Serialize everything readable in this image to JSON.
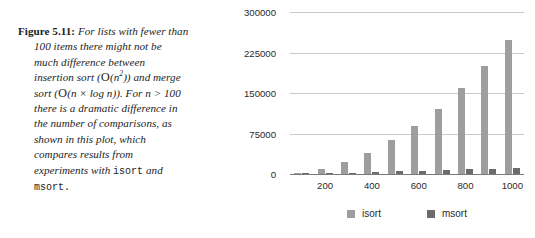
{
  "caption": {
    "figure_label": "Figure 5.11:",
    "lines": [
      "For lists with fewer than",
      "100 items there might not be",
      "much difference between",
      "insertion sort (O(n2)) and merge",
      "sort (O(n × log n)). For n > 100",
      "there is a dramatic difference in",
      "the number of comparisons, as",
      "shown in this plot, which",
      "compares results from",
      "experiments with isort and",
      "msort."
    ],
    "line1": "For lists with fewer than",
    "line2": "100 items there might not be",
    "line3": "much difference between",
    "line4_a": "insertion sort (",
    "line4_cal": "O",
    "line4_b": "(n",
    "line4_exp": "2",
    "line4_c": ")) and merge",
    "line5_a": "sort (",
    "line5_cal": "O",
    "line5_b": "(n × log n)). For ",
    "line5_n": "n",
    "line5_c": " > 100",
    "line6": "there is a dramatic difference in",
    "line7": "the number of comparisons, as",
    "line8": "shown in this plot, which",
    "line9": "compares results from",
    "line10_a": "experiments with ",
    "line10_mono": "isort",
    "line10_b": " and",
    "line11_mono": "msort",
    "line11_b": "."
  },
  "chart_data": {
    "type": "bar",
    "title": "",
    "xlabel": "",
    "ylabel": "",
    "ylim": [
      0,
      300000
    ],
    "yticks": [
      0,
      75000,
      150000,
      225000,
      300000
    ],
    "ytick_labels": [
      "0",
      "75000",
      "150000",
      "225000",
      "300000"
    ],
    "grid": true,
    "legend_position": "bottom",
    "categories": [
      100,
      200,
      300,
      400,
      500,
      600,
      700,
      800,
      900,
      1000
    ],
    "xtick_labels": [
      "",
      "200",
      "",
      "400",
      "",
      "600",
      "",
      "800",
      "",
      "1000"
    ],
    "series": [
      {
        "name": "isort",
        "color": "#9e9e9e",
        "values": [
          2500,
          10000,
          22500,
          40000,
          63000,
          90000,
          122000,
          160000,
          202000,
          250000
        ]
      },
      {
        "name": "msort",
        "color": "#6b6b6b",
        "values": [
          700,
          1700,
          2700,
          3800,
          5000,
          6200,
          7400,
          8700,
          10000,
          11300
        ]
      }
    ]
  },
  "legend": {
    "items": [
      {
        "label": "isort",
        "color": "#9e9e9e"
      },
      {
        "label": "msort",
        "color": "#6b6b6b"
      }
    ],
    "isort_label": "isort",
    "msort_label": "msort"
  },
  "colors": {
    "isort": "#9e9e9e",
    "msort": "#6b6b6b",
    "gridline": "#c9c9c9",
    "axis": "#7a7a7a",
    "text": "#2a2a2a"
  }
}
